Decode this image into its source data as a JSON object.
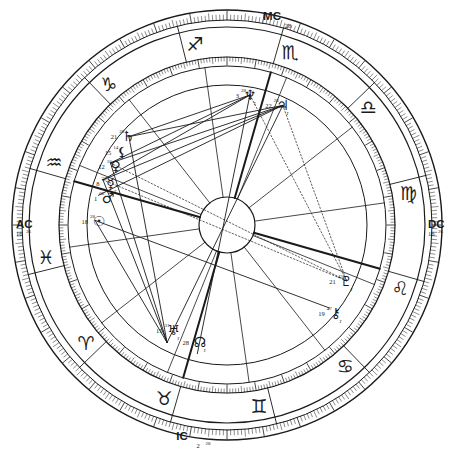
{
  "chart_title": "Natal Horoscope Wheel",
  "chart_data": {
    "type": "scatter",
    "subtitle": "",
    "xlabel": "",
    "ylabel": "",
    "grid": true,
    "legend_position": "none",
    "wheel": {
      "outer_radius": 215,
      "zodiac_band_outer": 198,
      "zodiac_band_inner": 168,
      "house_ring": 140,
      "inner_circle": 28,
      "center_x": 227,
      "center_y": 225,
      "ascendant_degree": 196,
      "tick_marks": 360,
      "stroke_color": "#1a1a1a",
      "background": "#ffffff"
    },
    "axes": [
      {
        "name": "MC",
        "label": "MC",
        "degree": "28",
        "minute": "",
        "angle_deg": 286,
        "position": "top"
      },
      {
        "name": "AC",
        "label": "AC",
        "degree": "16",
        "minute": "26",
        "angle_deg": 196,
        "position": "left"
      },
      {
        "name": "DC",
        "label": "DC",
        "degree": "16",
        "minute": "26",
        "angle_deg": 16,
        "position": "right"
      },
      {
        "name": "IC",
        "label": "IC",
        "degree": "2",
        "minute": "28",
        "angle_deg": 106,
        "position": "bottom"
      }
    ],
    "signs": [
      {
        "name": "aries",
        "glyph": "♈",
        "label": "Aries",
        "angle_deg": 320
      },
      {
        "name": "pisces",
        "glyph": "♓",
        "label": "Pisces",
        "angle_deg": 350
      },
      {
        "name": "aquarius",
        "glyph": "♒",
        "label": "Aquarius",
        "angle_deg": 20
      },
      {
        "name": "capricorn",
        "glyph": "♑",
        "label": "Capricorn",
        "angle_deg": 50
      },
      {
        "name": "sagittarius",
        "glyph": "♐",
        "label": "Sagittarius",
        "angle_deg": 80
      },
      {
        "name": "scorpio",
        "glyph": "♏",
        "label": "Scorpio",
        "angle_deg": 110
      },
      {
        "name": "libra",
        "glyph": "♎",
        "label": "Libra",
        "angle_deg": 140
      },
      {
        "name": "virgo",
        "glyph": "♍",
        "label": "Virgo",
        "angle_deg": 170
      },
      {
        "name": "leo",
        "glyph": "♌",
        "label": "Leo",
        "angle_deg": 200
      },
      {
        "name": "cancer",
        "glyph": "♋",
        "label": "Cancer",
        "angle_deg": 230
      },
      {
        "name": "gemini",
        "glyph": "♊",
        "label": "Gemini",
        "angle_deg": 260
      },
      {
        "name": "taurus",
        "glyph": "♉",
        "label": "Taurus",
        "angle_deg": 290
      }
    ],
    "planets": [
      {
        "name": "uranus",
        "glyph": "♅",
        "label": "Uranus",
        "degree": "15",
        "minute": "31",
        "retrograde": true,
        "angle_deg": 297,
        "radius": 118
      },
      {
        "name": "north-node",
        "glyph": "☊",
        "label": "North Node",
        "degree": "28",
        "minute": "",
        "retrograde": true,
        "angle_deg": 283,
        "radius": 120
      },
      {
        "name": "chiron",
        "glyph": "⚷",
        "label": "Chiron",
        "degree": "19",
        "minute": "47",
        "retrograde": true,
        "angle_deg": 219,
        "radius": 140
      },
      {
        "name": "saturn",
        "glyph": "♄",
        "label": "Saturn",
        "degree": "21",
        "minute": "28",
        "retrograde": false,
        "angle_deg": 42,
        "radius": 133
      },
      {
        "name": "lilith",
        "glyph": "⚸",
        "label": "Lilith",
        "degree": "15",
        "minute": "14",
        "retrograde": false,
        "angle_deg": 35,
        "radius": 128
      },
      {
        "name": "venus",
        "glyph": "♀",
        "label": "Venus",
        "degree": "12",
        "minute": "10",
        "retrograde": false,
        "angle_deg": 28,
        "radius": 126
      },
      {
        "name": "mercury",
        "glyph": "☿",
        "label": "Mercury",
        "degree": "8",
        "minute": "23",
        "retrograde": true,
        "angle_deg": 20,
        "radius": 124
      },
      {
        "name": "mars",
        "glyph": "♂",
        "label": "Mars",
        "degree": "1",
        "minute": "06",
        "retrograde": false,
        "angle_deg": 13,
        "radius": 122
      },
      {
        "name": "sun",
        "glyph": "☉",
        "label": "Sun",
        "degree": "18",
        "minute": "28",
        "retrograde": false,
        "angle_deg": 2,
        "radius": 128
      },
      {
        "name": "pluto",
        "glyph": "♇",
        "label": "Pluto",
        "degree": "21",
        "minute": "43",
        "retrograde": true,
        "angle_deg": 205,
        "radius": 132
      },
      {
        "name": "jupiter",
        "glyph": "♃",
        "label": "Jupiter",
        "degree": "22",
        "minute": "28",
        "retrograde": true,
        "angle_deg": 115,
        "radius": 132
      },
      {
        "name": "neptune",
        "glyph": "♆",
        "label": "Neptune",
        "degree": "3",
        "minute": "28",
        "retrograde": true,
        "angle_deg": 100,
        "radius": 132
      }
    ],
    "aspect_lines": [
      {
        "from": "uranus",
        "to": "sun",
        "style": "solid"
      },
      {
        "from": "uranus",
        "to": "saturn",
        "style": "solid"
      },
      {
        "from": "uranus",
        "to": "venus",
        "style": "solid"
      },
      {
        "from": "uranus",
        "to": "mercury",
        "style": "solid"
      },
      {
        "from": "uranus",
        "to": "jupiter",
        "style": "solid"
      },
      {
        "from": "jupiter",
        "to": "saturn",
        "style": "solid"
      },
      {
        "from": "jupiter",
        "to": "venus",
        "style": "solid"
      },
      {
        "from": "jupiter",
        "to": "mercury",
        "style": "solid"
      },
      {
        "from": "jupiter",
        "to": "mars",
        "style": "solid"
      },
      {
        "from": "neptune",
        "to": "saturn",
        "style": "solid"
      },
      {
        "from": "neptune",
        "to": "venus",
        "style": "solid"
      },
      {
        "from": "neptune",
        "to": "mercury",
        "style": "solid"
      },
      {
        "from": "pluto",
        "to": "venus",
        "style": "dotted"
      },
      {
        "from": "pluto",
        "to": "mercury",
        "style": "dotted"
      },
      {
        "from": "pluto",
        "to": "jupiter",
        "style": "dotted"
      },
      {
        "from": "neptune",
        "to": "pluto",
        "style": "dotted"
      },
      {
        "from": "north-node",
        "to": "neptune",
        "style": "solid"
      },
      {
        "from": "chiron",
        "to": "sun",
        "style": "solid"
      }
    ]
  }
}
